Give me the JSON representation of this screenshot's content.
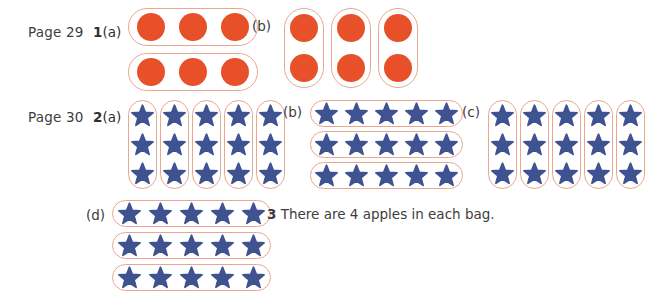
{
  "document": {
    "type": "answer-key-worksheet",
    "background_color": "#ffffff",
    "text_color": "#3d3d3d"
  },
  "tokens": {
    "circle": {
      "shape": "circle",
      "color": "#e8502a",
      "name": "orange-circle"
    },
    "star": {
      "shape": "star",
      "color": "#3f5291",
      "name": "blue-star"
    },
    "pill": {
      "outline_color": "#e9a78f",
      "fill": "#ffffff"
    }
  },
  "rows": [
    {
      "page_label": "Page 29",
      "question_number": "1",
      "parts": [
        {
          "label": "(a)",
          "token": "circle",
          "orientation": "horizontal",
          "group_count": 2,
          "items_per_group": 3,
          "total_items": 6
        },
        {
          "label": "(b)",
          "token": "circle",
          "orientation": "vertical",
          "group_count": 3,
          "items_per_group": 2,
          "total_items": 6
        }
      ]
    },
    {
      "page_label": "Page 30",
      "question_number": "2",
      "parts": [
        {
          "label": "(a)",
          "token": "star",
          "orientation": "vertical",
          "group_count": 5,
          "items_per_group": 3,
          "total_items": 15
        },
        {
          "label": "(b)",
          "token": "star",
          "orientation": "horizontal",
          "group_count": 3,
          "items_per_group": 5,
          "total_items": 15
        },
        {
          "label": "(c)",
          "token": "star",
          "orientation": "vertical",
          "group_count": 5,
          "items_per_group": 3,
          "total_items": 15
        },
        {
          "label": "(d)",
          "token": "star",
          "orientation": "horizontal",
          "group_count": 3,
          "items_per_group": 5,
          "total_items": 15
        }
      ]
    }
  ],
  "question3": {
    "number": "3",
    "text": "There are 4 apples in each bag."
  }
}
